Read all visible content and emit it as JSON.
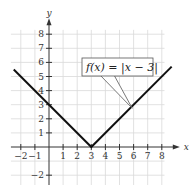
{
  "chart_data": {
    "type": "line",
    "title": "",
    "function_label": "f(x) = |x − 3|",
    "xlabel": "x",
    "ylabel": "y",
    "xlim": [
      -2.7,
      8.9
    ],
    "ylim": [
      -2.7,
      9.3
    ],
    "x_ticks": [
      -2,
      -1,
      1,
      2,
      3,
      4,
      5,
      6,
      7,
      8
    ],
    "x_tick_labels": [
      "−2",
      "−1",
      "1",
      "2",
      "3",
      "4",
      "5",
      "6",
      "7",
      "8"
    ],
    "y_ticks": [
      -2,
      1,
      2,
      3,
      4,
      5,
      6,
      7,
      8
    ],
    "y_tick_labels": [
      "−2",
      "1",
      "2",
      "3",
      "4",
      "5",
      "6",
      "7",
      "8"
    ],
    "grid": true,
    "series": [
      {
        "name": "f(x) = |x − 3|",
        "x": [
          -2.5,
          3,
          8.7
        ],
        "y": [
          5.5,
          0,
          5.7
        ]
      }
    ]
  }
}
